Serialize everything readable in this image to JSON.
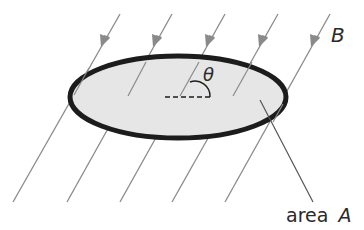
{
  "diagram": {
    "labels": {
      "field": "B",
      "angle": "θ",
      "area_word": "area",
      "area_symbol": "A"
    },
    "colors": {
      "background": "#ffffff",
      "surface_fill": "#e6e6e6",
      "surface_edge": "#1c1c1c",
      "field_line": "#8a8a8a",
      "text": "#2a2a2a"
    },
    "surface": {
      "shape": "ellipse",
      "cx": 178,
      "cy": 97,
      "rx": 108,
      "ry": 41
    },
    "field_lines": [
      {
        "x1": 120,
        "y1": 14,
        "x2": 13,
        "y2": 202
      },
      {
        "x1": 172,
        "y1": 14,
        "x2": 67,
        "y2": 202
      },
      {
        "x1": 225,
        "y1": 14,
        "x2": 120,
        "y2": 202
      },
      {
        "x1": 278,
        "y1": 14,
        "x2": 172,
        "y2": 202
      },
      {
        "x1": 330,
        "y1": 14,
        "x2": 225,
        "y2": 202
      }
    ],
    "field_line_count": 5,
    "field_direction": "down-left"
  }
}
